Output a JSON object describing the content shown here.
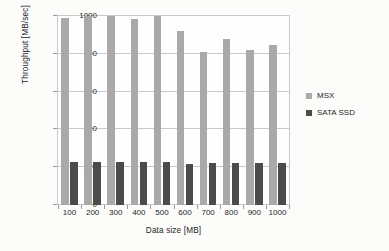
{
  "chart_data": {
    "type": "bar",
    "title": "",
    "subtitle": "",
    "xlabel": "Data size [MB]",
    "ylabel": "Throughput [MB/sec]",
    "categories": [
      "100",
      "200",
      "300",
      "400",
      "500",
      "600",
      "700",
      "800",
      "900",
      "1000"
    ],
    "series": [
      {
        "name": "MSX",
        "color": "#a9a9a9",
        "values": [
          990,
          1000,
          998,
          985,
          998,
          920,
          810,
          878,
          822,
          847
        ]
      },
      {
        "name": "SATA SSD",
        "color": "#4b4b4b",
        "values": [
          228,
          228,
          228,
          227,
          227,
          216,
          220,
          222,
          223,
          224
        ]
      }
    ],
    "ylim": [
      0,
      1000
    ],
    "yticks": [
      0,
      200,
      400,
      600,
      800,
      1000
    ],
    "ytick_labels": [
      "0",
      "200",
      "400",
      "600",
      "800",
      "1000"
    ],
    "grid": true,
    "grid_axis": "y",
    "legend_position": "right",
    "annotations": []
  },
  "legend": {
    "entries": [
      {
        "label": "MSX",
        "color": "#a9a9a9"
      },
      {
        "label": "SATA SSD",
        "color": "#4b4b4b"
      }
    ]
  },
  "axes": {
    "x_title": "Data size [MB]",
    "y_title": "Throughput [MB/sec]"
  }
}
